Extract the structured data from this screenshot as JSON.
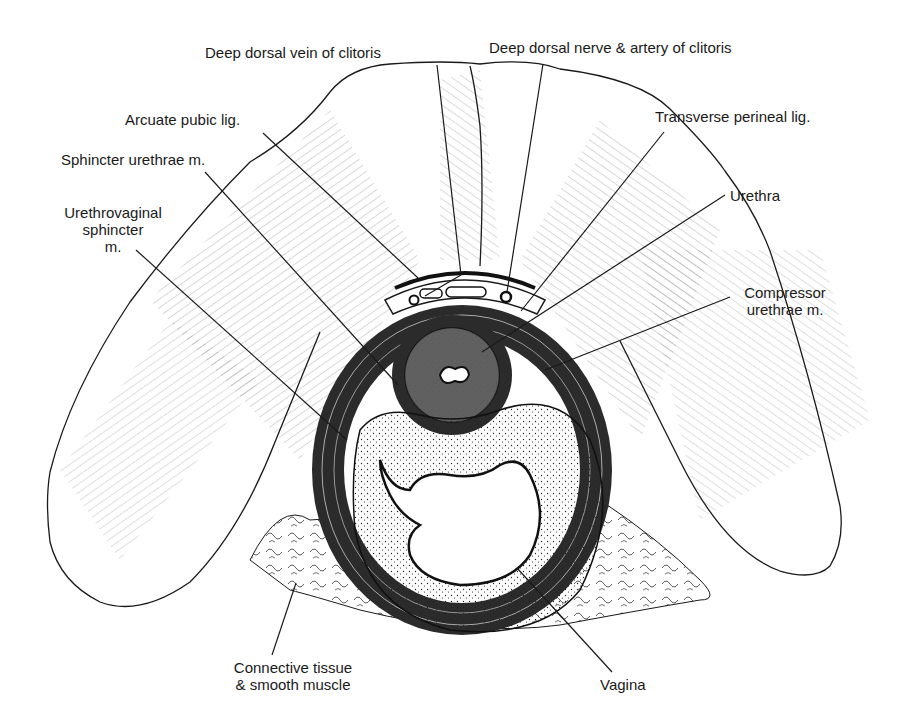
{
  "figure": {
    "style": "black-and-white pen-and-ink anatomical drawing",
    "background": "#ffffff",
    "ink": "#1a1a1a"
  },
  "labels": [
    {
      "id": "deep-dorsal-vein",
      "text": "Deep dorsal vein of clitoris",
      "x": 205,
      "y": 44
    },
    {
      "id": "deep-dorsal-nerve-artery",
      "text": "Deep dorsal nerve & artery of clitoris",
      "x": 489,
      "y": 39
    },
    {
      "id": "arcuate-pubic-lig",
      "text": "Arcuate pubic lig.",
      "x": 125,
      "y": 111
    },
    {
      "id": "transverse-perineal-lig",
      "text": "Transverse perineal lig.",
      "x": 655,
      "y": 108
    },
    {
      "id": "sphincter-urethrae",
      "text": "Sphincter urethrae m.",
      "x": 61,
      "y": 151
    },
    {
      "id": "urethra",
      "text": "Urethra",
      "x": 730,
      "y": 187
    },
    {
      "id": "urethrovaginal-sphincter",
      "lines": [
        "Urethrovaginal",
        "sphincter",
        "m."
      ],
      "x": 48,
      "y": 204
    },
    {
      "id": "compressor-urethrae",
      "lines": [
        "Compressor",
        "urethrae m."
      ],
      "x": 735,
      "y": 284
    },
    {
      "id": "connective-tissue",
      "lines": [
        "Connective tissue",
        "& smooth muscle"
      ],
      "x": 213,
      "y": 659
    },
    {
      "id": "vagina",
      "text": "Vagina",
      "x": 600,
      "y": 676
    }
  ],
  "leaders": [
    {
      "id": "deep-dorsal-vein",
      "from": [
        437,
        65
      ],
      "to": [
        461,
        275
      ]
    },
    {
      "id": "deep-dorsal-vein-b",
      "from": [
        461,
        275
      ],
      "to": [
        425,
        296
      ]
    },
    {
      "id": "deep-dorsal-nerve-artery",
      "from": [
        543,
        64
      ],
      "to": [
        507,
        292
      ]
    },
    {
      "id": "arcuate-pubic-lig",
      "from": [
        263,
        133
      ],
      "to": [
        418,
        278
      ]
    },
    {
      "id": "transverse-perineal-lig",
      "from": [
        664,
        132
      ],
      "to": [
        521,
        311
      ]
    },
    {
      "id": "sphincter-urethrae",
      "from": [
        205,
        172
      ],
      "to": [
        398,
        385
      ]
    },
    {
      "id": "urethra",
      "from": [
        725,
        195
      ],
      "to": [
        482,
        352
      ]
    },
    {
      "id": "urethrovaginal-sphincter",
      "from": [
        136,
        250
      ],
      "to": [
        347,
        440
      ]
    },
    {
      "id": "compressor-urethrae",
      "from": [
        730,
        297
      ],
      "to": [
        545,
        370
      ]
    },
    {
      "id": "connective-tissue",
      "from": [
        272,
        655
      ],
      "to": [
        296,
        583
      ]
    },
    {
      "id": "vagina",
      "from": [
        612,
        672
      ],
      "to": [
        517,
        568
      ]
    }
  ]
}
